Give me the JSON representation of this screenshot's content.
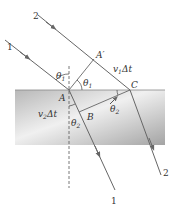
{
  "diagram": {
    "type": "refraction-wavefront-geometry",
    "colors": {
      "background": "#ffffff",
      "medium_light": "#f2f2f2",
      "medium_dark": "#a9a9a9",
      "ray": "#666666",
      "label": "#333333"
    },
    "rays": [
      {
        "id": "1",
        "label": "1",
        "incident_label": "1"
      },
      {
        "id": "2",
        "label": "2",
        "incident_label": "2"
      }
    ],
    "points": {
      "A": "A",
      "A_prime": "A′",
      "B": "B",
      "C": "C"
    },
    "labels": {
      "ray1_in": "1",
      "ray2_in": "2",
      "ray1_out": "1",
      "ray2_out": "2",
      "theta1_base": "θ",
      "theta1_sub": "1",
      "theta2_base": "θ",
      "theta2_sub": "2",
      "v1dt_v": "v",
      "v1dt_sub": "1",
      "v1dt_rest": "Δt",
      "v2dt_v": "v",
      "v2dt_sub": "2",
      "v2dt_rest": "Δt"
    }
  }
}
